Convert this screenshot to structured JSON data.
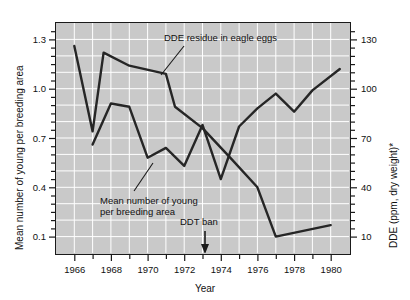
{
  "chart_data": {
    "type": "line",
    "title": "",
    "xlabel": "Year",
    "ylabel": "Mean number of young per breeding area",
    "ylabel_right": "DDE (ppm, dry weight)*",
    "grid": true,
    "legend_position": "inline-annotations",
    "xlim": [
      1965,
      1981
    ],
    "ylim_left": [
      0.0,
      1.4
    ],
    "ylim_right": [
      0,
      140
    ],
    "x_ticks_major": [
      1966,
      1968,
      1970,
      1972,
      1974,
      1976,
      1978,
      1980
    ],
    "x_ticks_minor": [
      1967,
      1969,
      1971,
      1973,
      1975,
      1977,
      1979
    ],
    "y_ticks_left": [
      1.3,
      1.0,
      0.7,
      0.4,
      0.1
    ],
    "y_ticks_right": [
      130,
      100,
      70,
      40,
      10
    ],
    "series": [
      {
        "name": "DDE residue in eagle eggs",
        "axis": "right",
        "units": "ppm, dry weight",
        "x": [
          1966,
          1967,
          1967.6,
          1969,
          1971,
          1971.5,
          1973,
          1974.6,
          1976,
          1977,
          1980
        ],
        "values": [
          126,
          74,
          122,
          114,
          109,
          89,
          76,
          57,
          40,
          10,
          17
        ]
      },
      {
        "name": "Mean number of young per breeding area",
        "axis": "left",
        "units": "young per breeding area",
        "x": [
          1967,
          1968,
          1969,
          1970,
          1971,
          1972,
          1973,
          1974,
          1975,
          1976,
          1977,
          1978,
          1979,
          1980.5
        ],
        "values": [
          0.66,
          0.91,
          0.89,
          0.58,
          0.64,
          0.53,
          0.78,
          0.45,
          0.77,
          0.88,
          0.97,
          0.86,
          0.99,
          1.12
        ]
      }
    ],
    "annotations": [
      {
        "name": "dde-label",
        "text": "DDE residue in eagle eggs",
        "leader": true
      },
      {
        "name": "young-label",
        "text_line1": "Mean number of young",
        "text_line2": "per breeding area",
        "leader": true
      },
      {
        "name": "ddt-ban-marker",
        "text": "DDT ban",
        "x": 1972.5,
        "arrow": "down"
      }
    ]
  },
  "axes": {
    "left_title": "Mean number of young per breeding area",
    "right_title": "DDE (ppm, dry weight)*",
    "x_title": "Year",
    "y_left_ticks": [
      "1.3",
      "1.0",
      "0.7",
      "0.4",
      "0.1"
    ],
    "y_right_ticks": [
      "130",
      "100",
      "70",
      "40",
      "10"
    ],
    "x_ticks": [
      "1966",
      "1968",
      "1970",
      "1972",
      "1974",
      "1976",
      "1978",
      "1980"
    ]
  },
  "annotations": {
    "dde_residue": "DDE residue in eagle eggs",
    "young_line1": "Mean number of young",
    "young_line2": "per breeding area",
    "ddt_ban": "DDT ban"
  },
  "colors": {
    "plot_background": "#c9c9c9",
    "gridline": "#ffffff",
    "axis": "#1a1a1a",
    "series_line": "#262626",
    "page_background": "#ffffff"
  }
}
